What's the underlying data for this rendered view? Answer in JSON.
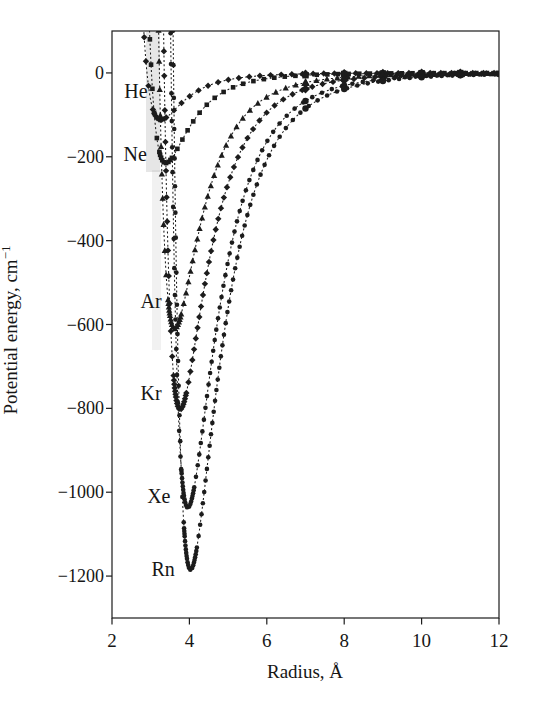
{
  "figure": {
    "background": "#ffffff",
    "ink_color": "#1c1c1c",
    "scan_smudge_color": "#8f8f8f"
  },
  "chart_data": {
    "type": "line",
    "title": "",
    "xlabel": "Radius, Å",
    "ylabel": "Potential energy, cm⁻¹",
    "ylabel_base": "Potential energy, cm",
    "ylabel_exponent": "−1",
    "xlim": [
      2,
      12
    ],
    "ylim": [
      -1300,
      100
    ],
    "x_ticks": [
      2,
      4,
      6,
      8,
      10,
      12
    ],
    "y_ticks": [
      0,
      -200,
      -400,
      -600,
      -800,
      -1000,
      -1200
    ],
    "grid": false,
    "legend": "inline-curve-labels",
    "curve_model": "lennard-jones-12-6",
    "series": [
      {
        "name": "He",
        "label": "He",
        "marker": "diamond",
        "r_min_angstrom": 3.26,
        "well_depth_cm1": -112,
        "label_pos": {
          "r": 2.62,
          "v": -44
        }
      },
      {
        "name": "Ne",
        "label": "Ne",
        "marker": "square",
        "r_min_angstrom": 3.39,
        "well_depth_cm1": -215,
        "label_pos": {
          "r": 2.6,
          "v": -193
        }
      },
      {
        "name": "Ar",
        "label": "Ar",
        "marker": "triangle",
        "r_min_angstrom": 3.62,
        "well_depth_cm1": -610,
        "label_pos": {
          "r": 3.01,
          "v": -544
        }
      },
      {
        "name": "Kr",
        "label": "Kr",
        "marker": "diamond",
        "r_min_angstrom": 3.76,
        "well_depth_cm1": -803,
        "label_pos": {
          "r": 3.01,
          "v": -763
        }
      },
      {
        "name": "Xe",
        "label": "Xe",
        "marker": "circle",
        "r_min_angstrom": 3.96,
        "well_depth_cm1": -1037,
        "label_pos": {
          "r": 3.21,
          "v": -1009
        }
      },
      {
        "name": "Rn",
        "label": "Rn",
        "marker": "circle",
        "r_min_angstrom": 4.03,
        "well_depth_cm1": -1185,
        "label_pos": {
          "r": 3.32,
          "v": -1183
        }
      }
    ]
  }
}
